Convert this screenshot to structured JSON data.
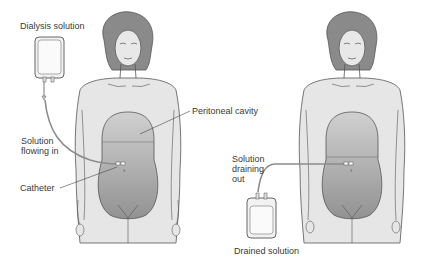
{
  "labels": {
    "dialysis_solution": "Dialysis solution",
    "peritoneal_cavity": "Peritoneal cavity",
    "solution_flowing_in_1": "Solution",
    "solution_flowing_in_2": "flowing in",
    "catheter": "Catheter",
    "solution_draining_out_1": "Solution",
    "solution_draining_out_2": "draining",
    "solution_draining_out_3": "out",
    "drained_solution": "Drained solution"
  },
  "colors": {
    "skin": "#e6e6e6",
    "outline": "#555555",
    "hair": "#8a8a8a",
    "cavity_top": "#c9c9c9",
    "cavity_bottom": "#9a9a9a",
    "tube": "#8c8c8c",
    "text": "#3a3a3a"
  }
}
